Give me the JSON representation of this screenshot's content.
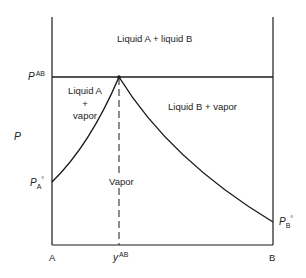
{
  "diagram": {
    "type": "pressure-composition phase diagram (azeotrope, immiscible liquids)",
    "y_axis": {
      "label": "P"
    },
    "x_axis": {
      "left_label": "A",
      "right_label": "B",
      "marker_label": "y",
      "marker_sup": "AB"
    },
    "pressure_marks": {
      "azeotrope": {
        "base": "P",
        "sup": "AB"
      },
      "pure_A": {
        "base": "P",
        "sub": "A",
        "deg": "°"
      },
      "pure_B": {
        "base": "P",
        "sub": "B",
        "deg": "°"
      }
    },
    "regions": {
      "top": "Liquid A + liquid B",
      "left_line1": "Liquid A",
      "left_line2": "+",
      "left_line3": "vapor",
      "right": "Liquid B + vapor",
      "bottom": "Vapor"
    },
    "colors": {
      "line": "#1a1a1a",
      "background": "#ffffff"
    }
  }
}
